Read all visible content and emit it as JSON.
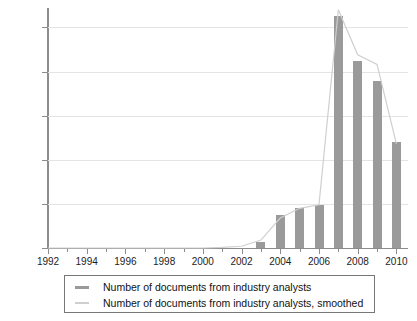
{
  "chart_data": {
    "type": "bar",
    "title": "",
    "subtitle": "",
    "xlabel": "",
    "ylabel": "",
    "xlim": [
      1992,
      2010.6
    ],
    "ylim": [
      0,
      27200
    ],
    "grid": true,
    "legend_position": "bottom",
    "x_tick_labels": [
      "1992",
      "1994",
      "1996",
      "1998",
      "2000",
      "2002",
      "2004",
      "2006",
      "2008",
      "2010"
    ],
    "x_tick_values": [
      1992,
      1994,
      1996,
      1998,
      2000,
      2002,
      2004,
      2006,
      2008,
      2010
    ],
    "x_minor_tick_values": [
      1993,
      1995,
      1997,
      1999,
      2001,
      2003,
      2005,
      2007,
      2009
    ],
    "y_tick_labels": [
      "0",
      "5000",
      "10000",
      "15000",
      "20000",
      "25000"
    ],
    "y_tick_values": [
      0,
      5000,
      10000,
      15000,
      20000,
      25000
    ],
    "categories": [
      1992,
      1993,
      1994,
      1995,
      1996,
      1997,
      1998,
      1999,
      2000,
      2001,
      2002,
      2003,
      2004,
      2005,
      2006,
      2007,
      2008,
      2009,
      2010
    ],
    "series": [
      {
        "name": "Number of documents from industry analysts",
        "render": "bar",
        "color": "#9a9a9a",
        "values": [
          0,
          0,
          0,
          0,
          0,
          0,
          0,
          0,
          0,
          0,
          0,
          700,
          3700,
          4500,
          4900,
          26300,
          21200,
          18900,
          12000
        ]
      },
      {
        "name": "Number of documents from industry analysts, smoothed",
        "render": "line",
        "color": "#cfcfcf",
        "values": [
          0,
          0,
          0,
          0,
          0,
          0,
          0,
          0,
          0,
          60,
          200,
          900,
          3400,
          4500,
          4900,
          27000,
          21900,
          20800,
          11800
        ]
      }
    ]
  },
  "legend": {
    "items": [
      {
        "label": "Number of documents from industry analysts",
        "swatch": "bar-swatch"
      },
      {
        "label": "Number of documents from industry analysts, smoothed",
        "swatch": "line-swatch"
      }
    ]
  }
}
